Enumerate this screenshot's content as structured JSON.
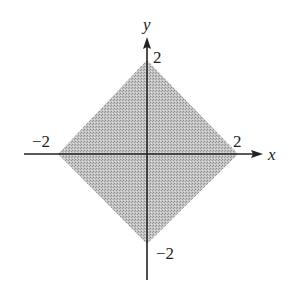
{
  "diagram": {
    "type": "region-plot",
    "axes": {
      "x_label": "x",
      "y_label": "y"
    },
    "tick_labels": {
      "x_pos": "2",
      "x_neg": "−2",
      "y_pos": "2",
      "y_neg": "−2"
    },
    "region": {
      "vertices": [
        [
          2,
          0
        ],
        [
          0,
          2
        ],
        [
          -2,
          0
        ],
        [
          0,
          -2
        ]
      ],
      "fill_color": "#b8b8b8",
      "pattern": "stippled"
    },
    "colors": {
      "axis": "#222222",
      "background": "#ffffff"
    }
  }
}
